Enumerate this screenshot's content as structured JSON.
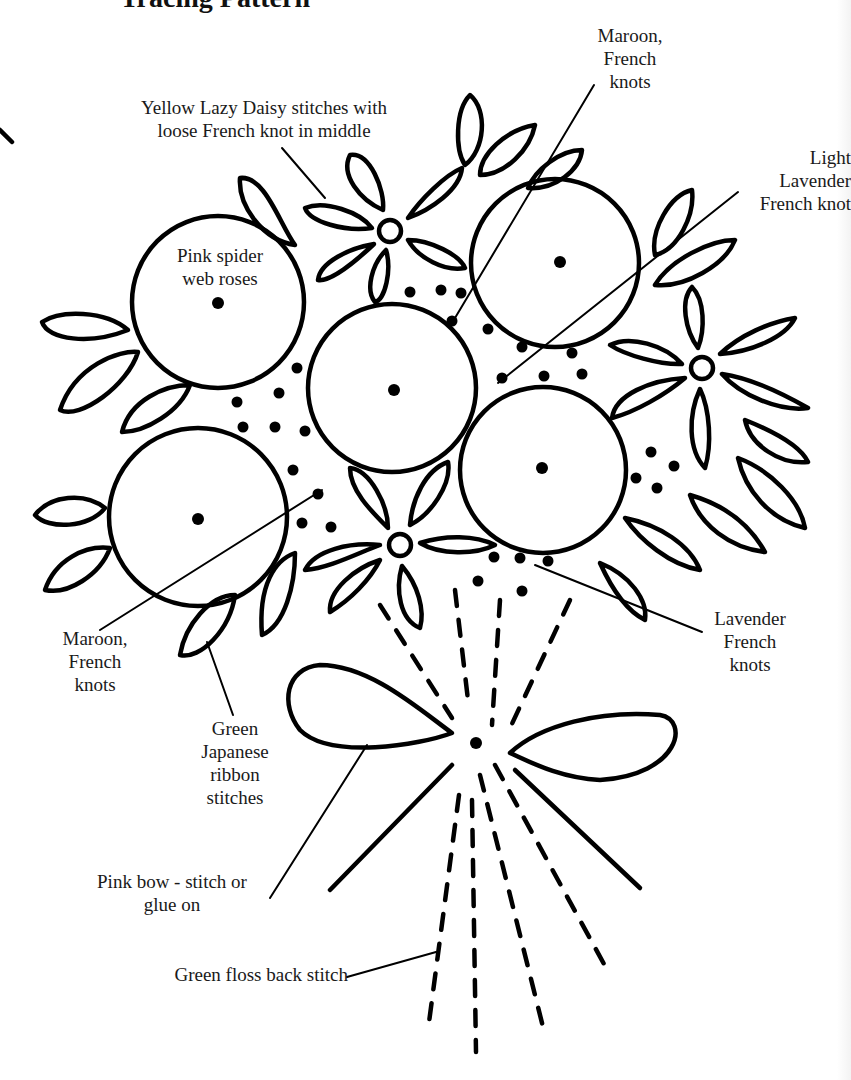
{
  "title": "Tracing Pattern",
  "labels": {
    "yellow_daisy": [
      "Yellow Lazy Daisy stitches with",
      "loose French knot in middle"
    ],
    "maroon_top": [
      "Maroon,",
      "French",
      "knots"
    ],
    "light_lavender": [
      "Light",
      "Lavender",
      "French knot"
    ],
    "pink_spider": [
      "Pink spider",
      "web roses"
    ],
    "maroon_bottom": [
      "Maroon,",
      "French",
      "knots"
    ],
    "lavender": [
      "Lavender",
      "French",
      "knots"
    ],
    "green_japanese": [
      "Green",
      "Japanese",
      "ribbon",
      "stitches"
    ],
    "pink_bow": [
      "Pink bow - stitch or",
      "glue on"
    ],
    "green_floss": [
      "Green floss back stitch"
    ]
  },
  "colors": {
    "ink": "#000000",
    "background": "#ffffff",
    "text": "#1a1a1a"
  }
}
